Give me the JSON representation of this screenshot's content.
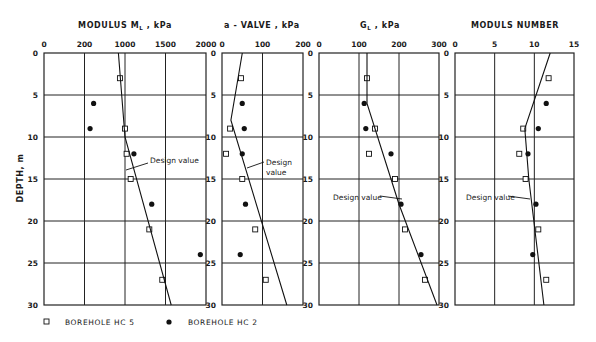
{
  "figure": {
    "y_axis_label": "DEPTH, m",
    "depth_ticks": [
      "0",
      "5",
      "10",
      "15",
      "20",
      "25",
      "30"
    ],
    "legend": [
      {
        "marker": "open-square",
        "label": "BOREHOLE   HC 5"
      },
      {
        "marker": "filled-circle",
        "label": "BOREHOLE   HC 2"
      }
    ]
  },
  "chart_data": [
    {
      "type": "scatter",
      "title": "MODULUS  M_L , kPa",
      "title_main": "MODULUS  M",
      "title_sub": "L",
      "title_tail": " , kPa",
      "x_tick_labels": [
        "0",
        "200",
        "1000",
        "1500",
        "2000"
      ],
      "xlim": [
        0,
        2000
      ],
      "ylabel": "DEPTH, m",
      "ylim": [
        0,
        30
      ],
      "y_inverted": true,
      "grid": true,
      "series": [
        {
          "name": "BOREHOLE HC 5",
          "marker": "open-square",
          "points": [
            [
              900,
              3
            ],
            [
              1000,
              9
            ],
            [
              1020,
              12
            ],
            [
              1070,
              15
            ],
            [
              1300,
              21
            ],
            [
              1460,
              27
            ]
          ]
        },
        {
          "name": "BOREHOLE HC 2",
          "marker": "filled-circle",
          "points": [
            [
              380,
              6
            ],
            [
              310,
              9
            ],
            [
              1110,
              12
            ],
            [
              1330,
              18
            ],
            [
              1930,
              24
            ]
          ]
        },
        {
          "name": "Design value",
          "marker": "line",
          "points": [
            [
              870,
              0
            ],
            [
              1000,
              10
            ],
            [
              1570,
              30
            ]
          ]
        }
      ],
      "annotation": "Design value"
    },
    {
      "type": "scatter",
      "title": "a - VALVE ,  kPa",
      "x_tick_labels": [
        "0",
        "100",
        "200"
      ],
      "xlim": [
        0,
        200
      ],
      "ylim": [
        0,
        30
      ],
      "y_inverted": true,
      "grid": true,
      "series": [
        {
          "name": "BOREHOLE HC 5",
          "marker": "open-square",
          "points": [
            [
              47,
              3
            ],
            [
              20,
              9
            ],
            [
              10,
              12
            ],
            [
              50,
              15
            ],
            [
              82,
              21
            ],
            [
              108,
              27
            ]
          ]
        },
        {
          "name": "BOREHOLE HC 2",
          "marker": "filled-circle",
          "points": [
            [
              50,
              6
            ],
            [
              55,
              9
            ],
            [
              50,
              12
            ],
            [
              58,
              18
            ],
            [
              45,
              24
            ]
          ]
        },
        {
          "name": "Design value",
          "marker": "line",
          "points": [
            [
              50,
              0
            ],
            [
              22,
              8
            ],
            [
              160,
              30
            ]
          ]
        }
      ],
      "annotation": "Design\nvalue"
    },
    {
      "type": "scatter",
      "title": "G_L , kPa",
      "title_main": "G",
      "title_sub": "L",
      "title_tail": " , kPa",
      "x_tick_labels": [
        "0",
        "100",
        "200",
        "300"
      ],
      "xlim": [
        0,
        300
      ],
      "ylim": [
        0,
        30
      ],
      "y_inverted": true,
      "grid": true,
      "series": [
        {
          "name": "BOREHOLE HC 5",
          "marker": "open-square",
          "points": [
            [
              120,
              3
            ],
            [
              140,
              9
            ],
            [
              125,
              12
            ],
            [
              190,
              15
            ],
            [
              215,
              21
            ],
            [
              265,
              27
            ]
          ]
        },
        {
          "name": "BOREHOLE HC 2",
          "marker": "filled-circle",
          "points": [
            [
              113,
              6
            ],
            [
              117,
              9
            ],
            [
              180,
              12
            ],
            [
              205,
              18
            ],
            [
              255,
              24
            ]
          ]
        },
        {
          "name": "Design value",
          "marker": "line",
          "points": [
            [
              120,
              0
            ],
            [
              120,
              6
            ],
            [
              200,
              18
            ],
            [
              295,
              30
            ]
          ]
        }
      ],
      "annotation": "Design value"
    },
    {
      "type": "scatter",
      "title": "MODULS  NUMBER",
      "x_tick_labels": [
        "0",
        "5",
        "10",
        "15"
      ],
      "xlim": [
        0,
        15
      ],
      "ylim": [
        0,
        30
      ],
      "y_inverted": true,
      "grid": true,
      "series": [
        {
          "name": "BOREHOLE HC 5",
          "marker": "open-square",
          "points": [
            [
              11.8,
              3
            ],
            [
              8.6,
              9
            ],
            [
              8.1,
              12
            ],
            [
              8.9,
              15
            ],
            [
              10.5,
              21
            ],
            [
              11.5,
              27
            ]
          ]
        },
        {
          "name": "BOREHOLE HC 2",
          "marker": "filled-circle",
          "points": [
            [
              11.5,
              6
            ],
            [
              10.5,
              9
            ],
            [
              9.2,
              12
            ],
            [
              10.2,
              18
            ],
            [
              9.8,
              24
            ]
          ]
        },
        {
          "name": "Design value",
          "marker": "line",
          "points": [
            [
              12,
              0
            ],
            [
              8.8,
              9
            ],
            [
              9.3,
              15
            ],
            [
              11.2,
              30
            ]
          ]
        }
      ],
      "annotation": "Design value"
    }
  ]
}
